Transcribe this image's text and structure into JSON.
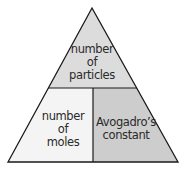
{
  "diagram": {
    "type": "formula-triangle",
    "top": {
      "label": "number of particles",
      "lines": [
        "number",
        "of",
        "particles"
      ],
      "fill": "#dcdcdc"
    },
    "bottom_left": {
      "label": "number of moles",
      "lines": [
        "number",
        "of",
        "moles"
      ],
      "fill": "#f4f4f4"
    },
    "bottom_right": {
      "label": "Avogadro's constant",
      "lines": [
        "Avogadro’s",
        "constant"
      ],
      "fill": "#cdcdcd"
    },
    "stroke": "#1a1a1a"
  }
}
